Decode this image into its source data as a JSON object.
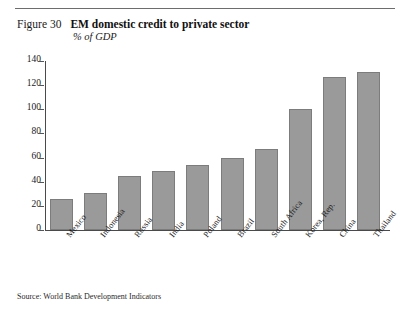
{
  "figure": {
    "label": "Figure 30",
    "title": "EM domestic credit to private sector",
    "subtitle": "% of GDP",
    "source": "Source: World Bank Development Indicators"
  },
  "colors": {
    "bar_fill": "#9a9a9a",
    "bar_border": "#7c7c7c",
    "axis": "#4a4a4a",
    "rule": "#6d6d6d",
    "text": "#1a1a1a"
  },
  "chart_data": {
    "type": "bar",
    "title": "EM domestic credit to private sector",
    "subtitle": "% of GDP",
    "xlabel": "",
    "ylabel": "% of GDP",
    "ylim": [
      0,
      140
    ],
    "yticks": [
      0,
      20,
      40,
      60,
      80,
      100,
      120,
      140
    ],
    "ytick_labels": [
      "0",
      "20",
      "40",
      "60",
      "80",
      "100",
      "120",
      "140"
    ],
    "grid": false,
    "legend": null,
    "categories": [
      "Mexico",
      "Indonesia",
      "Russia",
      "India",
      "Poland",
      "Brazil",
      "South Africa",
      "Korea, Rep.",
      "China",
      "Thailand"
    ],
    "values": [
      26,
      31,
      45,
      49,
      54,
      60,
      67,
      100,
      127,
      131
    ],
    "source": "Source: World Bank Development Indicators"
  }
}
